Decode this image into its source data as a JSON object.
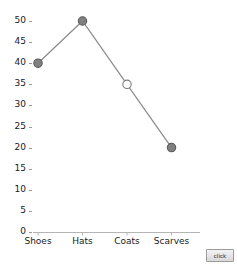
{
  "chart_data": {
    "type": "line",
    "title": "",
    "xlabel": "",
    "ylabel": "",
    "categories": [
      "Shoes",
      "Hats",
      "Coats",
      "Scarves"
    ],
    "values": [
      40,
      50,
      35,
      20
    ],
    "series": [
      {
        "name": "",
        "values": [
          40,
          50,
          35,
          20
        ],
        "line_color": "#8a8a8a",
        "marker_shape": "circle"
      }
    ],
    "point_styles": [
      {
        "category": "Shoes",
        "value": 40,
        "marker_fill": "#808080",
        "marker_stroke": "#5a5a5a",
        "filled": true
      },
      {
        "category": "Hats",
        "value": 50,
        "marker_fill": "#808080",
        "marker_stroke": "#5a5a5a",
        "filled": true
      },
      {
        "category": "Coats",
        "value": 35,
        "marker_fill": "#ffffff",
        "marker_stroke": "#7d7d7d",
        "filled": false
      },
      {
        "category": "Scarves",
        "value": 20,
        "marker_fill": "#808080",
        "marker_stroke": "#5a5a5a",
        "filled": true
      }
    ],
    "ylim": [
      0,
      50
    ],
    "ytick_step": 5,
    "ytick_labels": [
      "50",
      "45",
      "40",
      "35",
      "30",
      "25",
      "20",
      "15",
      "10",
      "5",
      "0"
    ],
    "ytick_values": [
      50,
      45,
      40,
      35,
      30,
      25,
      20,
      15,
      10,
      5,
      0
    ],
    "grid": false,
    "legend": "none",
    "background_color": "#ffffff",
    "axis_color": "#b5b5b5"
  },
  "controls": {
    "click_button_label": "click"
  }
}
